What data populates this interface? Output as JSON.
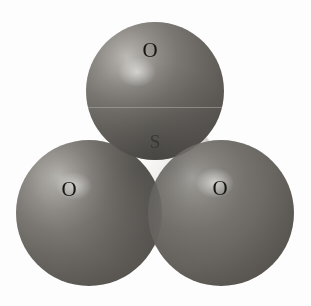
{
  "figure": {
    "name": "sulfur-trioxide-space-filling-model",
    "width": 311,
    "height": 306,
    "background_color": "#fdfdfd",
    "rendering": "grayscale scanned space-filling (CPK) molecular model"
  },
  "molecule": {
    "formula": "SO3",
    "atoms": [
      {
        "id": "o-top",
        "element_label": "O",
        "role": "oxygen",
        "position": "top-center",
        "color": "#6b6863",
        "center_x": 155,
        "center_y": 91,
        "radius": 69
      },
      {
        "id": "s-center",
        "element_label": "S",
        "role": "sulfur",
        "position": "center",
        "color": "#e2e0dc",
        "center_x": 156,
        "center_y": 180,
        "radius": 66
      },
      {
        "id": "o-left",
        "element_label": "O",
        "role": "oxygen",
        "position": "bottom-left",
        "color": "#6b6863",
        "center_x": 89,
        "center_y": 213,
        "radius": 73
      },
      {
        "id": "o-right",
        "element_label": "O",
        "role": "oxygen",
        "position": "bottom-right",
        "color": "#6b6863",
        "center_x": 221,
        "center_y": 213,
        "radius": 73
      }
    ]
  },
  "labels": {
    "oxygen_top": "O",
    "oxygen_left": "O",
    "oxygen_right": "O",
    "sulfur_center": "S"
  },
  "artifacts": {
    "scanline_note": "horizontal scan line across top sphere",
    "watermark_top": "",
    "watermark_mid": "",
    "watermark_bottom": ""
  },
  "colors": {
    "page_background": "#ffffff",
    "oxygen_base": "#6b6863",
    "oxygen_shadow": "#4c4945",
    "oxygen_highlight": "#bdbbb6",
    "sulfur_base": "#e2e0dc",
    "sulfur_highlight": "#ffffff",
    "sulfur_shadow": "#9a968f",
    "label_text": "#1d1c1a"
  }
}
